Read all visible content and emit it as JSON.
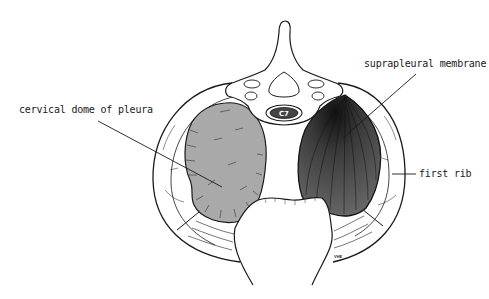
{
  "figure": {
    "vertebra_label": "C7",
    "signature": "VHE",
    "labels": [
      {
        "id": "cervical-dome",
        "text": "cervical dome of pleura",
        "x": 19,
        "y": 104,
        "target": [
          222,
          187
        ]
      },
      {
        "id": "suprapleural-membrane",
        "text": "suprapleural membrane",
        "x": 364,
        "y": 58,
        "target": [
          343,
          138
        ]
      },
      {
        "id": "first-rib",
        "text": "first rib",
        "x": 419,
        "y": 168,
        "target": [
          392,
          174
        ]
      }
    ],
    "colors": {
      "outline": "#1a1a1a",
      "left_dome_fill": "#a9a9a9",
      "right_dome_fill": "#555555",
      "background": "#ffffff"
    }
  }
}
